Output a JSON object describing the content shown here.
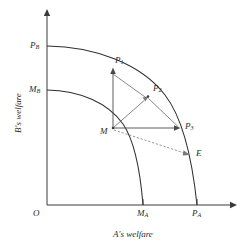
{
  "figure": {
    "type": "diagram",
    "background_color": "#ffffff",
    "line_color": "#2e2e2e",
    "axes": {
      "x_axis_label": "A's welfare",
      "y_axis_label": "B's welfare",
      "origin_label": "O",
      "x_axis_arrow": true,
      "y_axis_arrow": true
    },
    "axis_ticks": {
      "x": [
        {
          "name": "M_A",
          "label_main": "M",
          "label_sub": "A"
        },
        {
          "name": "P_A",
          "label_main": "P",
          "label_sub": "A"
        }
      ],
      "y": [
        {
          "name": "P_B",
          "label_main": "P",
          "label_sub": "B"
        },
        {
          "name": "M_B",
          "label_main": "M",
          "label_sub": "B"
        }
      ]
    },
    "curves": [
      {
        "name": "outer-frontier",
        "description": "Grand utility possibility frontier from P_B to P_A"
      },
      {
        "name": "inner-frontier",
        "description": "Inner possibility frontier from M_B to M_A"
      }
    ],
    "points": [
      {
        "name": "M",
        "label_main": "M",
        "label_sub": "",
        "description": "Disagreement / status quo point"
      },
      {
        "name": "P1",
        "label_main": "P",
        "label_sub": "1",
        "description": "Vertical projection of M onto outer frontier"
      },
      {
        "name": "P2",
        "label_main": "P",
        "label_sub": "2",
        "description": "Diagonal projection of M onto outer frontier"
      },
      {
        "name": "P3",
        "label_main": "P",
        "label_sub": "3",
        "description": "Horizontal projection of M onto outer frontier"
      },
      {
        "name": "E",
        "label_main": "E",
        "label_sub": "",
        "description": "Endpoint of dashed ray from M on outer frontier"
      }
    ],
    "segments": [
      {
        "name": "M-to-P1",
        "style": "solid",
        "arrow": true
      },
      {
        "name": "M-to-P2",
        "style": "solid",
        "arrow": true
      },
      {
        "name": "M-to-P3",
        "style": "solid",
        "arrow": true
      },
      {
        "name": "M-to-E",
        "style": "dashed",
        "arrow": true
      },
      {
        "name": "P1-to-P2",
        "style": "solid",
        "arrow": false
      },
      {
        "name": "P2-to-P3",
        "style": "solid",
        "arrow": false
      }
    ]
  }
}
